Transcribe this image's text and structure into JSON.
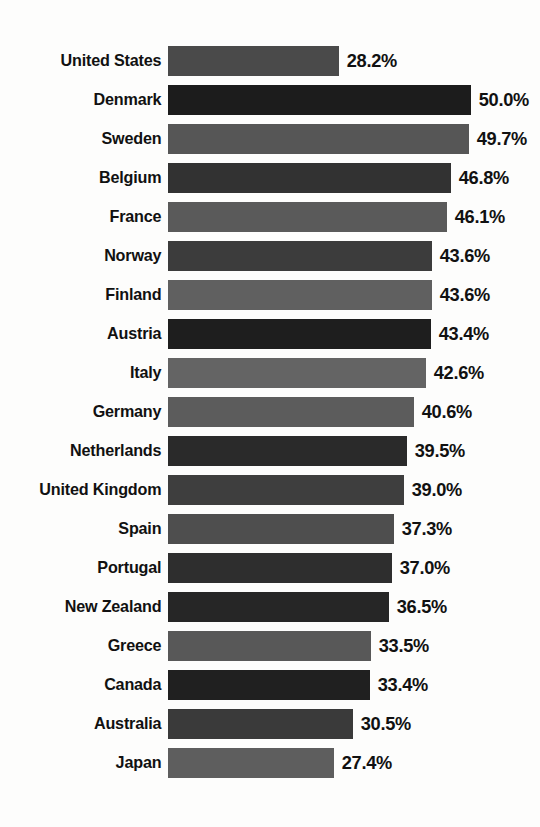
{
  "chart_data": {
    "type": "bar",
    "orientation": "horizontal",
    "title": "",
    "subtitle": "",
    "xlabel": "",
    "ylabel": "",
    "grid": false,
    "legend": null,
    "axis_visible": false,
    "value_suffix": "%",
    "xlim": [
      0,
      50
    ],
    "categories": [
      "United States",
      "Denmark",
      "Sweden",
      "Belgium",
      "France",
      "Norway",
      "Finland",
      "Austria",
      "Italy",
      "Germany",
      "Netherlands",
      "United Kingdom",
      "Spain",
      "Portugal",
      "New Zealand",
      "Greece",
      "Canada",
      "Australia",
      "Japan"
    ],
    "values": [
      28.2,
      50.0,
      49.7,
      46.8,
      46.1,
      43.6,
      43.6,
      43.4,
      42.6,
      40.6,
      39.5,
      39.0,
      37.3,
      37.0,
      36.5,
      33.5,
      33.4,
      30.5,
      27.4
    ],
    "value_labels": [
      "28.2%",
      "50.0%",
      "49.7%",
      "46.8%",
      "46.1%",
      "43.6%",
      "43.6%",
      "43.4%",
      "42.6%",
      "40.6%",
      "39.5%",
      "39.0%",
      "37.3%",
      "37.0%",
      "36.5%",
      "33.5%",
      "33.4%",
      "30.5%",
      "27.4%"
    ],
    "bar_colors": [
      "#4a4a4a",
      "#1c1c1c",
      "#565656",
      "#323232",
      "#5a5a5a",
      "#3c3c3c",
      "#606060",
      "#1e1e1e",
      "#646464",
      "#5c5c5c",
      "#2a2a2a",
      "#3e3e3e",
      "#4e4e4e",
      "#2e2e2e",
      "#262626",
      "#585858",
      "#202020",
      "#3a3a3a",
      "#5e5e5e"
    ]
  },
  "rows": [
    {
      "label": "United States",
      "value_label": "28.2%",
      "value": 28.2,
      "color": "#4a4a4a"
    },
    {
      "label": "Denmark",
      "value_label": "50.0%",
      "value": 50.0,
      "color": "#1c1c1c"
    },
    {
      "label": "Sweden",
      "value_label": "49.7%",
      "value": 49.7,
      "color": "#565656"
    },
    {
      "label": "Belgium",
      "value_label": "46.8%",
      "value": 46.8,
      "color": "#323232"
    },
    {
      "label": "France",
      "value_label": "46.1%",
      "value": 46.1,
      "color": "#5a5a5a"
    },
    {
      "label": "Norway",
      "value_label": "43.6%",
      "value": 43.6,
      "color": "#3c3c3c"
    },
    {
      "label": "Finland",
      "value_label": "43.6%",
      "value": 43.6,
      "color": "#606060"
    },
    {
      "label": "Austria",
      "value_label": "43.4%",
      "value": 43.4,
      "color": "#1e1e1e"
    },
    {
      "label": "Italy",
      "value_label": "42.6%",
      "value": 42.6,
      "color": "#646464"
    },
    {
      "label": "Germany",
      "value_label": "40.6%",
      "value": 40.6,
      "color": "#5c5c5c"
    },
    {
      "label": "Netherlands",
      "value_label": "39.5%",
      "value": 39.5,
      "color": "#2a2a2a"
    },
    {
      "label": "United Kingdom",
      "value_label": "39.0%",
      "value": 39.0,
      "color": "#3e3e3e"
    },
    {
      "label": "Spain",
      "value_label": "37.3%",
      "value": 37.3,
      "color": "#4e4e4e"
    },
    {
      "label": "Portugal",
      "value_label": "37.0%",
      "value": 37.0,
      "color": "#2e2e2e"
    },
    {
      "label": "New Zealand",
      "value_label": "36.5%",
      "value": 36.5,
      "color": "#262626"
    },
    {
      "label": "Greece",
      "value_label": "33.5%",
      "value": 33.5,
      "color": "#585858"
    },
    {
      "label": "Canada",
      "value_label": "33.4%",
      "value": 33.4,
      "color": "#202020"
    },
    {
      "label": "Australia",
      "value_label": "30.5%",
      "value": 30.5,
      "color": "#3a3a3a"
    },
    {
      "label": "Japan",
      "value_label": "27.4%",
      "value": 27.4,
      "color": "#5e5e5e"
    }
  ],
  "layout": {
    "bar_origin_px": 175,
    "px_per_unit": 6.05,
    "bar_height_px": 30,
    "row_gap_px": 9,
    "label_column_px": 168,
    "background": "#fdfdfc",
    "text_color": "#111111"
  }
}
